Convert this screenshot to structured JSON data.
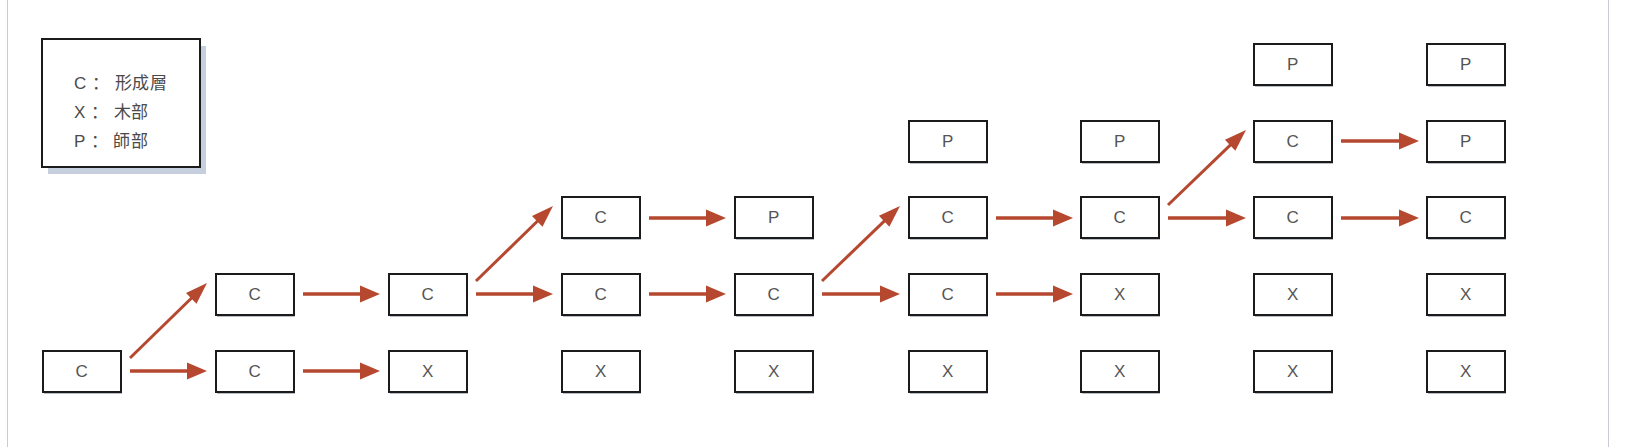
{
  "diagram": {
    "legend": {
      "lines": [
        "C ： 形成層",
        "X ： 木部",
        "P ： 師部"
      ]
    },
    "geometry": {
      "cell_width": 80,
      "cell_height": 43,
      "col_x": [
        42,
        215,
        388,
        561,
        734,
        908,
        1080,
        1253,
        1426
      ],
      "row_y": [
        43,
        120,
        196,
        273,
        350
      ]
    },
    "colors": {
      "arrow": "#b5482f",
      "box_border": "#1b1b1b",
      "box_fill": "#ffffff",
      "text": "#555555",
      "legend_shadow": "#c5cfdd",
      "page_border": "#c9ccd2",
      "background": "#ffffff"
    },
    "cells": [
      {
        "id": "c1r5",
        "col": 0,
        "row": 4,
        "label": "C"
      },
      {
        "id": "c2r4",
        "col": 1,
        "row": 3,
        "label": "C"
      },
      {
        "id": "c2r5",
        "col": 1,
        "row": 4,
        "label": "C"
      },
      {
        "id": "c3r4",
        "col": 2,
        "row": 3,
        "label": "C"
      },
      {
        "id": "c3r5",
        "col": 2,
        "row": 4,
        "label": "X"
      },
      {
        "id": "c4r3",
        "col": 3,
        "row": 2,
        "label": "C"
      },
      {
        "id": "c4r4",
        "col": 3,
        "row": 3,
        "label": "C"
      },
      {
        "id": "c4r5",
        "col": 3,
        "row": 4,
        "label": "X"
      },
      {
        "id": "c5r3",
        "col": 4,
        "row": 2,
        "label": "P"
      },
      {
        "id": "c5r4",
        "col": 4,
        "row": 3,
        "label": "C"
      },
      {
        "id": "c5r5",
        "col": 4,
        "row": 4,
        "label": "X"
      },
      {
        "id": "c6r2",
        "col": 5,
        "row": 1,
        "label": "P"
      },
      {
        "id": "c6r3",
        "col": 5,
        "row": 2,
        "label": "C"
      },
      {
        "id": "c6r4",
        "col": 5,
        "row": 3,
        "label": "C"
      },
      {
        "id": "c6r5",
        "col": 5,
        "row": 4,
        "label": "X"
      },
      {
        "id": "c7r2",
        "col": 6,
        "row": 1,
        "label": "P"
      },
      {
        "id": "c7r3",
        "col": 6,
        "row": 2,
        "label": "C"
      },
      {
        "id": "c7r4",
        "col": 6,
        "row": 3,
        "label": "X"
      },
      {
        "id": "c7r5",
        "col": 6,
        "row": 4,
        "label": "X"
      },
      {
        "id": "c8r1",
        "col": 7,
        "row": 0,
        "label": "P"
      },
      {
        "id": "c8r2",
        "col": 7,
        "row": 1,
        "label": "C"
      },
      {
        "id": "c8r3",
        "col": 7,
        "row": 2,
        "label": "C"
      },
      {
        "id": "c8r4",
        "col": 7,
        "row": 3,
        "label": "X"
      },
      {
        "id": "c8r5",
        "col": 7,
        "row": 4,
        "label": "X"
      },
      {
        "id": "c9r1",
        "col": 8,
        "row": 0,
        "label": "P"
      },
      {
        "id": "c9r2",
        "col": 8,
        "row": 1,
        "label": "P"
      },
      {
        "id": "c9r3",
        "col": 8,
        "row": 2,
        "label": "C"
      },
      {
        "id": "c9r4",
        "col": 8,
        "row": 3,
        "label": "X"
      },
      {
        "id": "c9r5",
        "col": 8,
        "row": 4,
        "label": "X"
      }
    ],
    "arrows": [
      {
        "id": "a1",
        "from": "c1r5",
        "to": "c2r4",
        "kind": "diagonal",
        "x1": 130,
        "y1": 358,
        "x2": 207,
        "y2": 283
      },
      {
        "id": "a2",
        "from": "c1r5",
        "to": "c2r5",
        "kind": "straight",
        "x1": 130,
        "y1": 371,
        "x2": 207,
        "y2": 371
      },
      {
        "id": "a3",
        "from": "c2r4",
        "to": "c3r4",
        "kind": "straight",
        "x1": 303,
        "y1": 294,
        "x2": 380,
        "y2": 294
      },
      {
        "id": "a4",
        "from": "c2r5",
        "to": "c3r5",
        "kind": "straight",
        "x1": 303,
        "y1": 371,
        "x2": 380,
        "y2": 371
      },
      {
        "id": "a5",
        "from": "c3r4",
        "to": "c4r3",
        "kind": "diagonal",
        "x1": 476,
        "y1": 281,
        "x2": 553,
        "y2": 206
      },
      {
        "id": "a6",
        "from": "c3r4",
        "to": "c4r4",
        "kind": "straight",
        "x1": 476,
        "y1": 294,
        "x2": 553,
        "y2": 294
      },
      {
        "id": "a7",
        "from": "c4r3",
        "to": "c5r3",
        "kind": "straight",
        "x1": 649,
        "y1": 218,
        "x2": 726,
        "y2": 218
      },
      {
        "id": "a8",
        "from": "c4r4",
        "to": "c5r4",
        "kind": "straight",
        "x1": 649,
        "y1": 294,
        "x2": 726,
        "y2": 294
      },
      {
        "id": "a9",
        "from": "c5r4",
        "to": "c6r3",
        "kind": "diagonal",
        "x1": 822,
        "y1": 281,
        "x2": 900,
        "y2": 206
      },
      {
        "id": "a10",
        "from": "c5r4",
        "to": "c6r4",
        "kind": "straight",
        "x1": 822,
        "y1": 294,
        "x2": 900,
        "y2": 294
      },
      {
        "id": "a11",
        "from": "c6r3",
        "to": "c7r3",
        "kind": "straight",
        "x1": 996,
        "y1": 218,
        "x2": 1073,
        "y2": 218
      },
      {
        "id": "a12",
        "from": "c6r4",
        "to": "c7r4",
        "kind": "straight",
        "x1": 996,
        "y1": 294,
        "x2": 1073,
        "y2": 294
      },
      {
        "id": "a13",
        "from": "c7r3",
        "to": "c8r2",
        "kind": "diagonal",
        "x1": 1168,
        "y1": 205,
        "x2": 1246,
        "y2": 130
      },
      {
        "id": "a14",
        "from": "c7r3",
        "to": "c8r3",
        "kind": "straight",
        "x1": 1168,
        "y1": 218,
        "x2": 1246,
        "y2": 218
      },
      {
        "id": "a15",
        "from": "c8r2",
        "to": "c9r2",
        "kind": "straight",
        "x1": 1341,
        "y1": 141,
        "x2": 1419,
        "y2": 141
      },
      {
        "id": "a16",
        "from": "c8r3",
        "to": "c9r3",
        "kind": "straight",
        "x1": 1341,
        "y1": 218,
        "x2": 1419,
        "y2": 218
      }
    ]
  }
}
